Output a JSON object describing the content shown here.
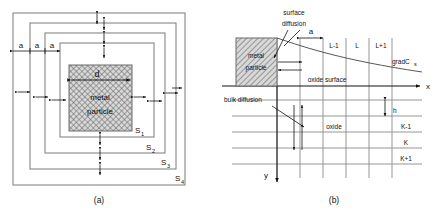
{
  "figure": {
    "panels": [
      {
        "id": "a",
        "caption": "(a)",
        "description": "nested square shells around a metal particle",
        "particle_label_line1": "metal",
        "particle_label_line2": "particle",
        "diameter_label": "d",
        "spacing_labels": [
          "a",
          "a",
          "a"
        ],
        "shell_labels": [
          "S",
          "S",
          "S",
          "S"
        ],
        "shell_subscripts": [
          "1",
          "2",
          "3",
          "4"
        ]
      },
      {
        "id": "b",
        "caption": "(b)",
        "description": "finite difference grid at an oxide surface",
        "particle_label_line1": "metal",
        "particle_label_line2": "particle",
        "surface_diffusion_line1": "surface",
        "surface_diffusion_line2": "diffusion",
        "bulk_diffusion_label": "bulk diffusion",
        "oxide_surface_label": "oxide surface",
        "oxide_label": "oxide",
        "grad_label": "gradC",
        "grad_subscript": "s",
        "spacing_label_x": "a",
        "spacing_label_y": "h",
        "column_labels": [
          "L-1",
          "L",
          "L+1"
        ],
        "row_labels": [
          "K-1",
          "K",
          "K+1"
        ],
        "axis_x": "x",
        "axis_y": "y"
      }
    ]
  },
  "colors": {
    "line": "#6f6f6f",
    "ink": "#111111",
    "hatch": "#555555",
    "hatch_fill": "#d8d8d8"
  }
}
